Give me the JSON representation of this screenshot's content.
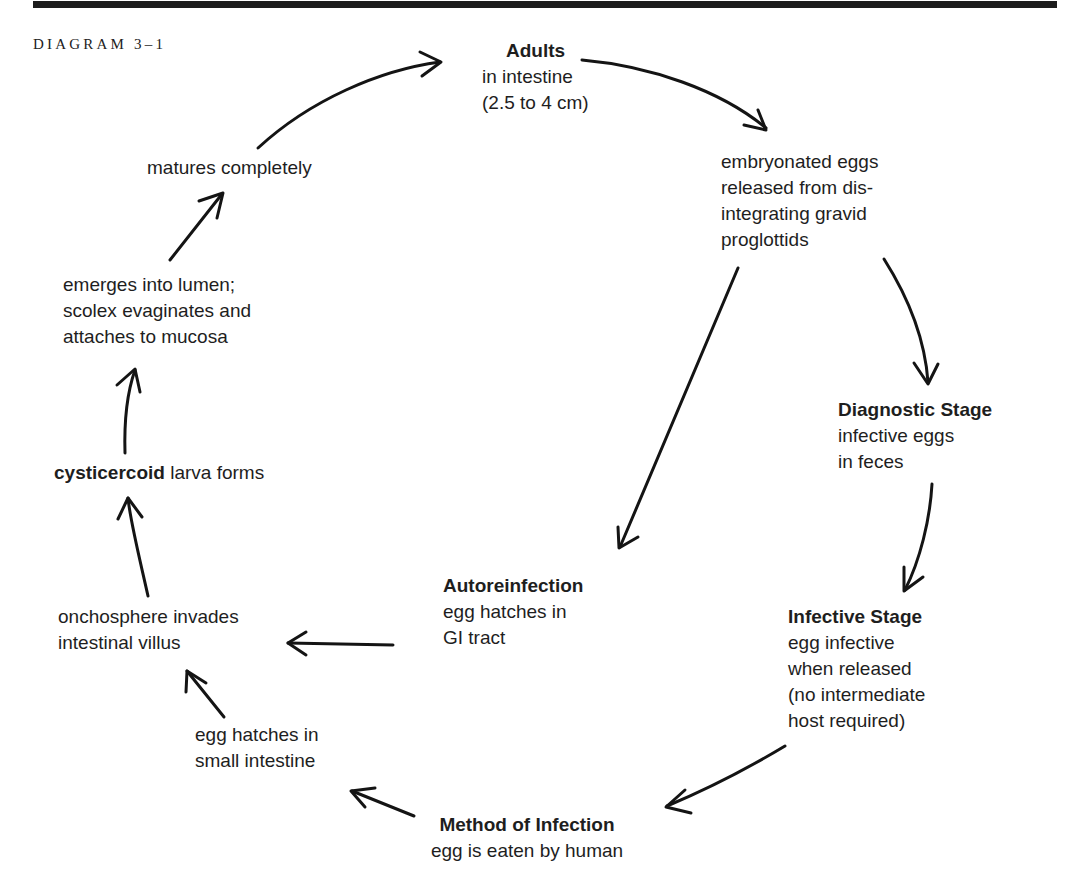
{
  "header": {
    "diagram_label": "DIAGRAM 3–1"
  },
  "colors": {
    "ink": "#1a1a1a",
    "background": "#ffffff",
    "rule": "#1c1c1c"
  },
  "nodes": {
    "adults": {
      "title": "Adults",
      "lines": [
        "in intestine",
        "(2.5 to 4 cm)"
      ]
    },
    "eggs_released": {
      "lines": [
        "embryonated eggs",
        "released from dis-",
        "integrating gravid",
        "proglottids"
      ]
    },
    "diagnostic_stage": {
      "title": "Diagnostic Stage",
      "lines": [
        "infective eggs",
        "in feces"
      ]
    },
    "infective_stage": {
      "title": "Infective Stage",
      "lines": [
        "egg infective",
        "when released",
        "(no intermediate",
        "host required)"
      ]
    },
    "method_of_infection": {
      "title": "Method of Infection",
      "lines": [
        "egg is eaten by human"
      ]
    },
    "egg_hatches_small_intestine": {
      "lines": [
        "egg hatches in",
        "small intestine"
      ]
    },
    "onchosphere": {
      "lines": [
        "onchosphere invades",
        "intestinal villus"
      ]
    },
    "autoreinfection": {
      "title": "Autoreinfection",
      "lines": [
        "egg hatches in",
        "GI tract"
      ]
    },
    "cysticercoid": {
      "bold": "cysticercoid",
      "rest": " larva forms"
    },
    "emerges": {
      "lines": [
        "emerges into lumen;",
        "scolex evaginates and",
        "attaches to mucosa"
      ]
    },
    "matures": {
      "lines": [
        "matures completely"
      ]
    }
  },
  "arrows": [
    {
      "from": "matures",
      "to": "adults",
      "icon": "arrow-curved"
    },
    {
      "from": "adults",
      "to": "eggs_released",
      "icon": "arrow-curved"
    },
    {
      "from": "eggs_released",
      "to": "diagnostic_stage",
      "icon": "arrow-curved"
    },
    {
      "from": "eggs_released",
      "to": "autoreinfection",
      "icon": "arrow-straight"
    },
    {
      "from": "diagnostic_stage",
      "to": "infective_stage",
      "icon": "arrow-curved"
    },
    {
      "from": "infective_stage",
      "to": "method_of_infection",
      "icon": "arrow-curved"
    },
    {
      "from": "method_of_infection",
      "to": "egg_hatches_small_intestine",
      "icon": "arrow-straight"
    },
    {
      "from": "egg_hatches_small_intestine",
      "to": "onchosphere",
      "icon": "arrow-straight"
    },
    {
      "from": "autoreinfection",
      "to": "onchosphere",
      "icon": "arrow-straight"
    },
    {
      "from": "onchosphere",
      "to": "cysticercoid",
      "icon": "arrow-curved"
    },
    {
      "from": "cysticercoid",
      "to": "emerges",
      "icon": "arrow-straight"
    },
    {
      "from": "emerges",
      "to": "matures",
      "icon": "arrow-straight"
    }
  ]
}
